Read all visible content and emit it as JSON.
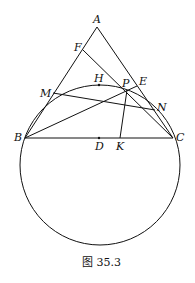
{
  "figure": {
    "caption": "图 35.3",
    "points": {
      "A": {
        "label": "A",
        "x": 97,
        "y": 27
      },
      "F": {
        "label": "F",
        "x": 83,
        "y": 50
      },
      "M": {
        "label": "M",
        "x": 53,
        "y": 93
      },
      "H": {
        "label": "H",
        "x": 99,
        "y": 85
      },
      "P": {
        "label": "P",
        "x": 127,
        "y": 90
      },
      "E": {
        "label": "E",
        "x": 137,
        "y": 85
      },
      "N": {
        "label": "N",
        "x": 155,
        "y": 110
      },
      "B": {
        "label": "B",
        "x": 25,
        "y": 138
      },
      "C": {
        "label": "C",
        "x": 173,
        "y": 138
      },
      "D": {
        "label": "D",
        "x": 99,
        "y": 138
      },
      "K": {
        "label": "K",
        "x": 120,
        "y": 138
      }
    },
    "circle": {
      "cx": 100,
      "cy": 165,
      "r": 80
    }
  }
}
